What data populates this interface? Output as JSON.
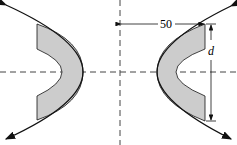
{
  "diagram": {
    "dimension_label": "50",
    "height_label": "d",
    "colors": {
      "fill": "#cccccc",
      "stroke": "#111111",
      "axis": "#444444"
    }
  }
}
